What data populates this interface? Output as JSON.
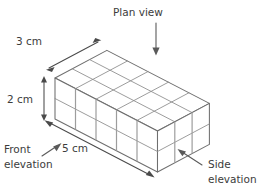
{
  "figure": {
    "title_alt": "Isometric cuboid of unit cubes with dimensions and view annotations",
    "colors": {
      "background": "#ffffff",
      "edge": "#6f6f6f",
      "grid": "#8a8a8a",
      "vertical_grid": "#9d9d9d",
      "text": "#3c3c3c",
      "arrow": "#4a4a4a",
      "callout_arrow": "#5a5a5a"
    },
    "solid": {
      "shape": "cuboid",
      "unit": "cube",
      "width_cubes": 5,
      "depth_cubes": 3,
      "height_cubes": 2,
      "total_cubes": 30,
      "projection": "isometric"
    },
    "dimensions": [
      {
        "id": "depth",
        "label": "3 cm",
        "value": 3,
        "unit": "cm",
        "axis": "depth",
        "arrow": "double-headed",
        "position": "upper-left"
      },
      {
        "id": "height",
        "label": "2 cm",
        "value": 2,
        "unit": "cm",
        "axis": "height",
        "arrow": "double-headed",
        "position": "left"
      },
      {
        "id": "width",
        "label": "5 cm",
        "value": 5,
        "unit": "cm",
        "axis": "width",
        "arrow": "double-headed",
        "position": "lower-left"
      }
    ],
    "callouts": [
      {
        "id": "plan-view",
        "label": "Plan view",
        "lines": [
          "Plan view"
        ],
        "arrow_direction": "down",
        "points_to": "top-face",
        "position": "top-center"
      },
      {
        "id": "front-elevation",
        "label": "Front elevation",
        "lines": [
          "Front",
          "elevation"
        ],
        "arrow_direction": "up-right",
        "points_to": "front-face",
        "position": "bottom-left"
      },
      {
        "id": "side-elevation",
        "label": "Side elevation",
        "lines": [
          "Side",
          "elevation"
        ],
        "arrow_direction": "up-left",
        "points_to": "right-face",
        "position": "bottom-right"
      }
    ]
  }
}
